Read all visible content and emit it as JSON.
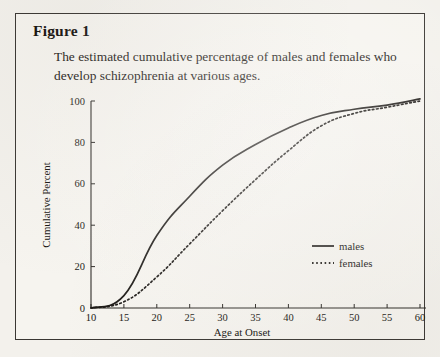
{
  "figure": {
    "title": "Figure 1",
    "caption": "The estimated cumulative percentage of males and females who develop schizophrenia at various ages."
  },
  "chart_data": {
    "type": "line",
    "title": "",
    "xlabel": "Age at Onset",
    "ylabel": "Cumulative Percent",
    "xlim": [
      10,
      60
    ],
    "ylim": [
      0,
      100
    ],
    "xticks": [
      10,
      15,
      20,
      25,
      30,
      35,
      40,
      45,
      50,
      55,
      60
    ],
    "xtick_labels": [
      "10",
      "15",
      "20",
      "25",
      "30",
      "35",
      "40",
      "45",
      "50",
      "55",
      "60"
    ],
    "yticks": [
      0,
      20,
      40,
      60,
      80,
      100
    ],
    "ytick_labels": [
      "0",
      "20",
      "40",
      "60",
      "80",
      "100"
    ],
    "grid": false,
    "legend_position": "center-right",
    "x": [
      10,
      15,
      20,
      25,
      30,
      35,
      40,
      45,
      50,
      55,
      60
    ],
    "series": [
      {
        "name": "males",
        "style": "solid",
        "values": [
          0,
          6,
          35,
          54,
          69,
          79,
          87,
          93,
          96,
          98,
          101
        ]
      },
      {
        "name": "females",
        "style": "dashed",
        "values": [
          0,
          3,
          15,
          31,
          47,
          62,
          76,
          88,
          94,
          97,
          100
        ]
      }
    ]
  },
  "legend": {
    "items": [
      {
        "label": "males",
        "style": "solid"
      },
      {
        "label": "females",
        "style": "dashed"
      }
    ]
  }
}
